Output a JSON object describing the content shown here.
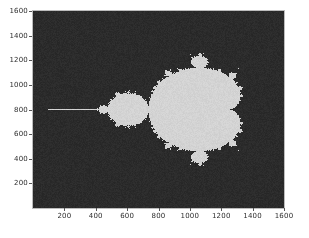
{
  "figure": {
    "facecolor": "#ffffff",
    "width": 309,
    "height": 238
  },
  "axes": {
    "background_color": "#2b2b2b",
    "spine_color": "#bdbdbd",
    "tick_color": "#555555",
    "ticklabel_color": "#2d2d2d",
    "pixel_left": 33,
    "pixel_top": 11,
    "pixel_width": 251,
    "pixel_height": 197
  },
  "chart_data": {
    "type": "heatmap",
    "title": "",
    "xlabel": "",
    "ylabel": "",
    "xlim": [
      0,
      1600
    ],
    "ylim": [
      1600,
      0
    ],
    "grid": false,
    "legend": null,
    "xticks": [
      200,
      400,
      600,
      800,
      1000,
      1200,
      1400,
      1600
    ],
    "xticklabels": [
      "200",
      "400",
      "600",
      "800",
      "1000",
      "1200",
      "1400",
      "1600"
    ],
    "yticks": [
      200,
      400,
      600,
      800,
      1000,
      1200,
      1400,
      1600
    ],
    "yticklabels": [
      "200",
      "400",
      "600",
      "800",
      "1000",
      "1200",
      "1400",
      "1600"
    ],
    "colormap": {
      "inside_color": "#d3d3d3",
      "outside_color": "#2b2b2b",
      "levels": 2
    },
    "image": {
      "width_px": 1600,
      "height_px": 1600,
      "complex_plane": {
        "re_min": -2.18,
        "re_max": 0.92,
        "im_min": -1.55,
        "im_max": 1.55
      },
      "max_iterations": 80,
      "escape_radius": 2.0,
      "features": [
        {
          "name": "main-cardioid",
          "center_px": [
            760,
            800
          ],
          "approx_width_px": 640
        },
        {
          "name": "period-2-bulb",
          "center_px": [
            300,
            800
          ],
          "approx_width_px": 300
        },
        {
          "name": "upper-period-3-bulb",
          "center_px": [
            730,
            420
          ]
        },
        {
          "name": "lower-period-3-bulb",
          "center_px": [
            730,
            1190
          ]
        },
        {
          "name": "left-antenna",
          "start_px": [
            0,
            800
          ],
          "end_px": [
            130,
            800
          ]
        }
      ]
    }
  }
}
